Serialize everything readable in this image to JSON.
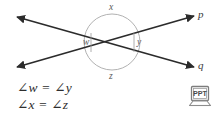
{
  "figure": {
    "background_color": "#ffffff",
    "line_color": "#2b2b2b",
    "arc_color": "#9a9a9a",
    "label_color": "#4a4a4a",
    "equation_color": "#2e2e2e"
  },
  "diagram": {
    "intersection": {
      "x": 112,
      "y": 42
    },
    "circle": {
      "cx": 112,
      "cy": 42,
      "r": 28,
      "stroke": "#a8a8a8"
    },
    "lines": [
      {
        "name": "line-p",
        "label": "p",
        "from": {
          "x": 17,
          "y": 67
        },
        "to": {
          "x": 194,
          "y": 16
        },
        "arrow_start": true,
        "arrow_end": true
      },
      {
        "name": "line-q",
        "label": "q",
        "from": {
          "x": 17,
          "y": 17
        },
        "to": {
          "x": 194,
          "y": 67
        },
        "arrow_start": true,
        "arrow_end": true
      }
    ],
    "line_labels": [
      {
        "text": "p",
        "x": 199,
        "y": 10
      },
      {
        "text": "q",
        "x": 199,
        "y": 61
      }
    ],
    "angle_labels": [
      {
        "name": "angle-x",
        "text": "x",
        "x": 109,
        "y": 3
      },
      {
        "name": "angle-w",
        "text": "w",
        "x": 85,
        "y": 38
      },
      {
        "name": "angle-y",
        "text": "y",
        "x": 138,
        "y": 39
      },
      {
        "name": "angle-z",
        "text": "z",
        "x": 109,
        "y": 73
      }
    ]
  },
  "equations": [
    {
      "name": "equation-w-y",
      "angle_symbol": "∠",
      "left_var": "w",
      "relation": "=",
      "right_var": "y",
      "text": "∠w = ∠y"
    },
    {
      "name": "equation-x-z",
      "angle_symbol": "∠",
      "left_var": "x",
      "relation": "=",
      "right_var": "z",
      "text": "∠x = ∠z"
    }
  ],
  "badge": {
    "name": "ppt-laptop-icon",
    "label": "PPT",
    "description": "laptop-icon"
  }
}
